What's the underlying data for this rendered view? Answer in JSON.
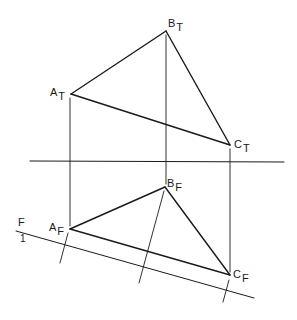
{
  "diagram": {
    "title": "",
    "type": "descriptive-geometry-projection",
    "colors": {
      "line": "#1a1a1a",
      "background": "#ffffff"
    },
    "points": {
      "A_T": {
        "main": "A",
        "sub": "T",
        "x": 71,
        "y": 94
      },
      "B_T": {
        "main": "B",
        "sub": "T",
        "x": 166,
        "y": 31
      },
      "C_T": {
        "main": "C",
        "sub": "T",
        "x": 230,
        "y": 145
      },
      "A_F": {
        "main": "A",
        "sub": "F",
        "x": 70,
        "y": 229
      },
      "B_F": {
        "main": "B",
        "sub": "F",
        "x": 165,
        "y": 187
      },
      "C_F": {
        "main": "C",
        "sub": "F",
        "x": 230,
        "y": 275
      }
    },
    "fold_lines": {
      "T_F": {
        "x1": 30,
        "y1": 161,
        "x2": 284,
        "y2": 162
      },
      "F_1": {
        "x1": 16,
        "y1": 231,
        "x2": 254,
        "y2": 298,
        "label_top": "F",
        "label_bottom": "1"
      }
    }
  }
}
